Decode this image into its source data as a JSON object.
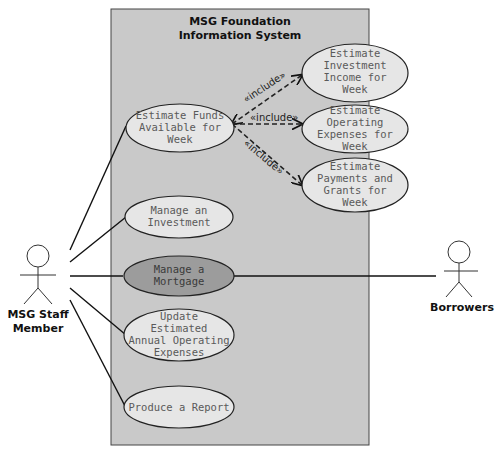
{
  "system": {
    "title_line1": "MSG Foundation",
    "title_line2": "Information System"
  },
  "actors": {
    "staff": {
      "line1": "MSG Staff",
      "line2": "Member"
    },
    "borrowers": {
      "line1": "Borrowers"
    }
  },
  "use_cases": {
    "funds": [
      "Estimate Funds",
      "Available for",
      "Week"
    ],
    "investment_income": [
      "Estimate",
      "Investment",
      "Income for",
      "Week"
    ],
    "operating_expenses": [
      "Estimate",
      "Operating",
      "Expenses for",
      "Week"
    ],
    "payments_grants": [
      "Estimate",
      "Payments and",
      "Grants for",
      "Week"
    ],
    "manage_investment": [
      "Manage an",
      "Investment"
    ],
    "manage_mortgage": [
      "Manage a",
      "Mortgage"
    ],
    "update_expenses": [
      "Update",
      "Estimated",
      "Annual Operating",
      "Expenses"
    ],
    "produce_report": [
      "Produce a Report"
    ]
  },
  "relations": {
    "include_label": "«include»"
  },
  "colors": {
    "system_bg": "#c9c9c9",
    "ellipse_fill": "#e6e6e6",
    "highlight_fill": "#9c9c9c",
    "line": "#111111"
  }
}
